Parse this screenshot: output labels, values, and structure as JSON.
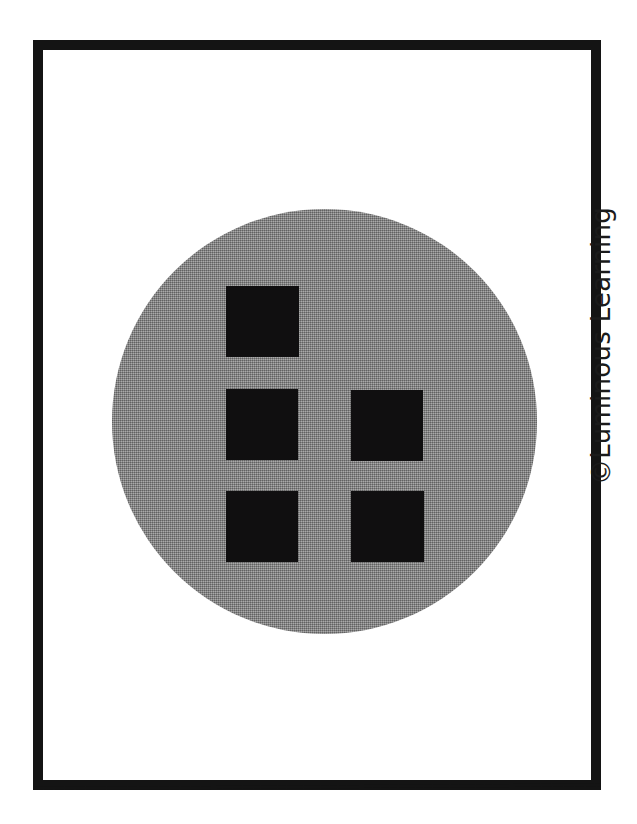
{
  "page": {
    "background_color": "#ffffff",
    "width": 637,
    "height": 824
  },
  "card": {
    "frame_color": "#141414",
    "frame_thickness_px": 10,
    "fill_color": "#ffffff"
  },
  "figure": {
    "name": "gray-circle-with-black-squares",
    "circle": {
      "shape": "circle",
      "fill_color": "#8c8c8c",
      "fill_style": "halftone-dither",
      "center_x": 314,
      "center_y": 411,
      "diameter_px": 425
    },
    "square_count_label": "5",
    "square_color": "#100f10",
    "squares": [
      {
        "id": "square-top-left",
        "row": 1,
        "column": 1,
        "x": 216,
        "y": 276,
        "width": 73,
        "height": 71
      },
      {
        "id": "square-middle-left",
        "row": 2,
        "column": 1,
        "x": 216,
        "y": 379,
        "width": 72,
        "height": 71
      },
      {
        "id": "square-middle-right",
        "row": 2,
        "column": 2,
        "x": 341,
        "y": 380,
        "width": 72,
        "height": 71
      },
      {
        "id": "square-bottom-left",
        "row": 3,
        "column": 1,
        "x": 216,
        "y": 481,
        "width": 72,
        "height": 71
      },
      {
        "id": "square-bottom-right",
        "row": 3,
        "column": 2,
        "x": 341,
        "y": 481,
        "width": 73,
        "height": 71
      }
    ]
  },
  "copyright": {
    "symbol": "©",
    "text": "©Luminous Learning",
    "brand": "Luminous Learning",
    "orientation": "rotated-90-counterclockwise",
    "color": "#1b1b1b"
  }
}
